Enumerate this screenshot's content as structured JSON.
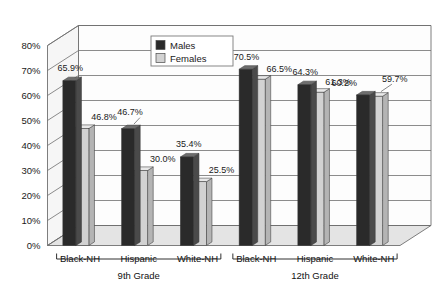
{
  "chart_data": {
    "type": "bar",
    "title": "",
    "subtitle": "",
    "xlabel": "",
    "ylabel": "",
    "ylim": [
      0,
      80
    ],
    "ytick_step": 10,
    "grid": true,
    "three_d": true,
    "legend_position": "top-center",
    "categories": [
      "Black-NH",
      "Hispanic",
      "White-NH",
      "Black-NH",
      "Hispanic",
      "White-NH"
    ],
    "groups": [
      {
        "label": "9th Grade",
        "categories": [
          "Black-NH",
          "Hispanic",
          "White-NH"
        ]
      },
      {
        "label": "12th Grade",
        "categories": [
          "Black-NH",
          "Hispanic",
          "White-NH"
        ]
      }
    ],
    "series": [
      {
        "name": "Males",
        "color": "#2a2a2a",
        "values": [
          65.9,
          46.7,
          35.4,
          70.5,
          64.3,
          60.2
        ]
      },
      {
        "name": "Females",
        "color": "#d2d2d2",
        "values": [
          46.8,
          30.0,
          25.5,
          66.5,
          61.3,
          59.7
        ]
      }
    ],
    "ytick_labels": [
      "0%",
      "10%",
      "20%",
      "30%",
      "40%",
      "50%",
      "60%",
      "70%",
      "80%"
    ],
    "data_labels": [
      "65.9%",
      "46.8%",
      "46.7%",
      "30.0%",
      "35.4%",
      "25.5%",
      "70.5%",
      "66.5%",
      "64.3%",
      "61.3%",
      "60.2%",
      "59.7%"
    ]
  },
  "legend": {
    "items": [
      {
        "label": "Males",
        "swatch": "#2a2a2a"
      },
      {
        "label": "Females",
        "swatch": "#d2d2d2"
      }
    ]
  },
  "axis": {
    "y_ticks": [
      "80%",
      "70%",
      "60%",
      "50%",
      "40%",
      "30%",
      "20%",
      "10%",
      "0%"
    ]
  },
  "colors": {
    "male_front": "#2a2a2a",
    "male_side": "#4a4a4a",
    "male_top": "#6d6d6d",
    "female_front": "#d2d2d2",
    "female_side": "#b4b4b4",
    "female_top": "#e8e8e8",
    "wall": "#fdfdfd",
    "floor": "#e4e4e4",
    "grid": "#6f6f6f",
    "text": "#1a1a1a"
  }
}
